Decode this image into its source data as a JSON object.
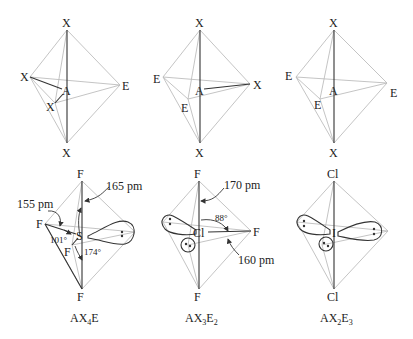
{
  "figure": {
    "top_row": [
      {
        "name": "ax4e-generic",
        "center": "A",
        "top": "X",
        "left": "X",
        "front": "X",
        "right": "E",
        "bottom": "X"
      },
      {
        "name": "ax3e2-generic",
        "center": "A",
        "top": "X",
        "left": "E",
        "front": "E",
        "right": "X",
        "bottom": "X"
      },
      {
        "name": "ax2e3-generic",
        "center": "A",
        "top": "X",
        "left": "E",
        "front": "E",
        "right": "E",
        "bottom": "X"
      }
    ],
    "bottom_row": [
      {
        "name": "sf4",
        "center": "S",
        "top": "F",
        "left": "F",
        "front": "F",
        "bottom": "F",
        "bond_axial": "165 pm",
        "bond_equatorial": "155 pm",
        "angle_equatorial": "101°",
        "angle_axial": "174°",
        "formula_main": "AX",
        "formula_sub1": "4",
        "formula_tail": "E",
        "formula_sub2": ""
      },
      {
        "name": "clf3",
        "center": "Cl",
        "top": "F",
        "right": "F",
        "bottom": "F",
        "bond_axial": "170 pm",
        "bond_equatorial": "160 pm",
        "angle": "88°",
        "formula_main": "AX",
        "formula_sub1": "3",
        "formula_tail": "E",
        "formula_sub2": "2"
      },
      {
        "name": "icl2-",
        "center": "I",
        "top": "Cl",
        "bottom": "Cl",
        "formula_main": "AX",
        "formula_sub1": "2",
        "formula_tail": "E",
        "formula_sub2": "3"
      }
    ]
  }
}
